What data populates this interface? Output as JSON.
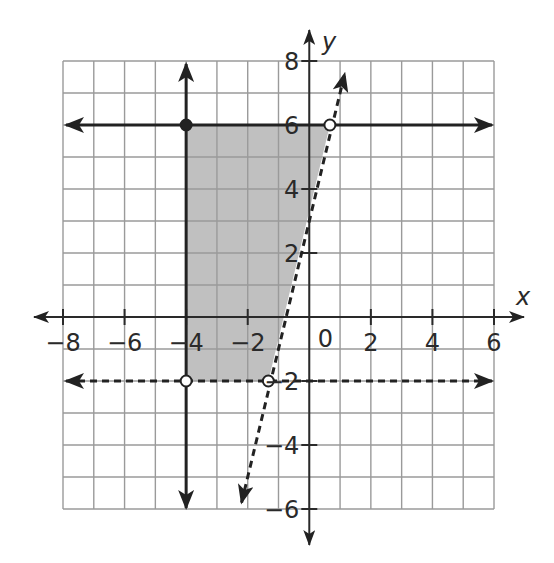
{
  "chart_data": {
    "type": "region",
    "title": "",
    "xlabel": "x",
    "ylabel": "y",
    "xlim": [
      -8,
      6
    ],
    "ylim": [
      -6,
      8
    ],
    "grid": true,
    "grid_step": 1,
    "x_tick_labels": [
      "-8",
      "-6",
      "-4",
      "-2",
      "0",
      "2",
      "4",
      "6"
    ],
    "x_ticks": [
      -8,
      -6,
      -4,
      -2,
      2,
      4,
      6
    ],
    "y_tick_labels": [
      "8",
      "6",
      "4",
      "2",
      "-2",
      "-4",
      "-6"
    ],
    "y_ticks": [
      8,
      6,
      4,
      2,
      -2,
      -4,
      -6
    ],
    "origin_label": "0",
    "lines": [
      {
        "name": "x = -4",
        "style": "solid",
        "kind": "vertical",
        "x": -4,
        "arrows": "both"
      },
      {
        "name": "y = 6",
        "style": "solid",
        "kind": "horizontal",
        "y": 6,
        "arrows": "both"
      },
      {
        "name": "y = -2",
        "style": "dashed",
        "kind": "horizontal",
        "y": -2,
        "arrows": "both"
      },
      {
        "name": "y = 4x + 10/3",
        "style": "dashed",
        "kind": "slanted",
        "slope": 4,
        "intercept": 3.33,
        "from": [
          -2.2,
          -5.8
        ],
        "to": [
          1.15,
          7.6
        ],
        "arrows": "both"
      }
    ],
    "points": [
      {
        "x": -4,
        "y": 6,
        "filled": true
      },
      {
        "x": 0.67,
        "y": 6,
        "filled": false
      },
      {
        "x": -4,
        "y": -2,
        "filled": false
      },
      {
        "x": -1.33,
        "y": -2,
        "filled": false
      }
    ],
    "shaded_region": {
      "vertices": [
        [
          -4,
          6
        ],
        [
          0.67,
          6
        ],
        [
          -1.33,
          -2
        ],
        [
          -4,
          -2
        ]
      ],
      "color": "#bdbdbd"
    }
  },
  "colors": {
    "grid": "#9a9a9a",
    "axis": "#2a2a2a",
    "shade": "#bdbdbd",
    "line": "#222222"
  }
}
